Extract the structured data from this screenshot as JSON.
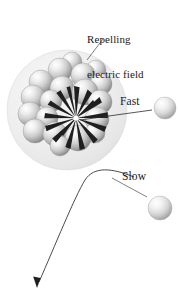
{
  "figure": {
    "background_color": "#ffffff"
  },
  "labels": {
    "field_line1": "Repelling",
    "field_line2": "electric field",
    "fast": "Fast",
    "slow": "Slow"
  },
  "colors": {
    "field_fill": "#ececec",
    "field_edge": "#dedede",
    "nucleon_light": "#ffffff",
    "nucleon_mid": "#cfcfcf",
    "nucleon_dark": "#8d8d8d",
    "burst": "#1f1f1f",
    "leader_line": "#3a3a3a",
    "trajectory": "#2a2a2a",
    "text": "#1a1a1a"
  },
  "field": {
    "name": "repelling-electric-field",
    "center_x": 67,
    "center_y": 110,
    "radius": 60
  },
  "nucleus": {
    "name": "nucleus-cluster",
    "center_x": 66,
    "center_y": 110,
    "nucleon_count": 19,
    "nucleons": [
      {
        "cx": 60,
        "cy": 70,
        "r": 12
      },
      {
        "cx": 83,
        "cy": 75,
        "r": 12
      },
      {
        "cx": 41,
        "cy": 82,
        "r": 12
      },
      {
        "cx": 62,
        "cy": 88,
        "r": 12
      },
      {
        "cx": 85,
        "cy": 92,
        "r": 13
      },
      {
        "cx": 101,
        "cy": 84,
        "r": 11
      },
      {
        "cx": 33,
        "cy": 97,
        "r": 12
      },
      {
        "cx": 51,
        "cy": 101,
        "r": 11
      },
      {
        "cx": 100,
        "cy": 102,
        "r": 12
      },
      {
        "cx": 30,
        "cy": 114,
        "r": 12
      },
      {
        "cx": 47,
        "cy": 118,
        "r": 11
      },
      {
        "cx": 97,
        "cy": 119,
        "r": 12
      },
      {
        "cx": 35,
        "cy": 131,
        "r": 12
      },
      {
        "cx": 55,
        "cy": 134,
        "r": 12
      },
      {
        "cx": 78,
        "cy": 138,
        "r": 13
      },
      {
        "cx": 95,
        "cy": 133,
        "r": 10
      },
      {
        "cx": 72,
        "cy": 62,
        "r": 10
      },
      {
        "cx": 96,
        "cy": 70,
        "r": 10
      },
      {
        "cx": 60,
        "cy": 146,
        "r": 10
      }
    ]
  },
  "burst": {
    "name": "field-burst",
    "center_x": 76,
    "center_y": 118,
    "spike_count": 16,
    "max_length": 33
  },
  "particles": [
    {
      "name": "fast-particle",
      "label": "Fast",
      "cx": 165,
      "cy": 108,
      "r": 11
    },
    {
      "name": "slow-particle",
      "label": "Slow",
      "cx": 160,
      "cy": 208,
      "r": 12
    }
  ],
  "leaders": {
    "field_leader": {
      "name": "field-leader-line",
      "x1": 103,
      "y1": 39,
      "x2": 87,
      "y2": 60
    },
    "fast_leader": {
      "name": "fast-leader-line",
      "x1": 152,
      "y1": 110,
      "x2": 80,
      "y2": 120
    },
    "slow_leader": {
      "name": "slow-leader-line",
      "x1": 147,
      "y1": 197,
      "x2": 112,
      "y2": 178
    }
  },
  "trajectory": {
    "name": "slow-particle-trajectory",
    "description": "curved deflection path ending in arrowhead",
    "start_x": 134,
    "start_y": 177,
    "apex_x": 88,
    "apex_y": 171,
    "end_x": 38,
    "end_y": 285
  }
}
